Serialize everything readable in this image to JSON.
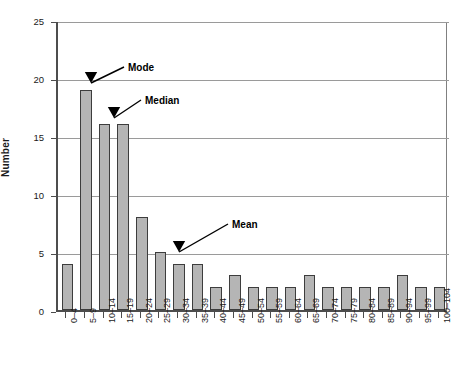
{
  "chart_data": {
    "type": "bar",
    "title": "",
    "xlabel": "",
    "ylabel": "Number",
    "ylim": [
      0,
      25
    ],
    "ytick_values": [
      0,
      5,
      10,
      15,
      20,
      25
    ],
    "ytick_labels": [
      "0",
      "5",
      "10",
      "15",
      "20",
      "25"
    ],
    "grid": "horizontal",
    "legend": "none",
    "bar_color": "#b5b5b5",
    "bar_edge_color": "#3d3d3d",
    "categories": [
      "0–4",
      "5–9",
      "10–14",
      "15–19",
      "20–24",
      "25–29",
      "30–34",
      "35–39",
      "40–44",
      "45–49",
      "50–54",
      "55–59",
      "60–64",
      "65–69",
      "70–74",
      "75–79",
      "80–84",
      "85–89",
      "90–94",
      "95–99",
      "100–104"
    ],
    "values": [
      4,
      19,
      16,
      16,
      8,
      5,
      4,
      4,
      2,
      3,
      2,
      2,
      2,
      3,
      2,
      2,
      2,
      2,
      3,
      2,
      2
    ],
    "annotations": [
      {
        "text": "Mode",
        "label_x": 128,
        "label_y": 62,
        "tip_x": 91,
        "tip_y": 83,
        "tail_x": 124,
        "tail_y": 67
      },
      {
        "text": "Median",
        "label_x": 145,
        "label_y": 95,
        "tip_x": 114,
        "tip_y": 118,
        "tail_x": 141,
        "tail_y": 100
      },
      {
        "text": "Mean",
        "label_x": 232,
        "label_y": 219,
        "tip_x": 179,
        "tip_y": 252,
        "tail_x": 228,
        "tail_y": 224
      }
    ]
  }
}
